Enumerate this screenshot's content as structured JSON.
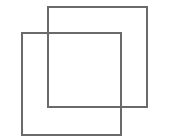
{
  "icon": {
    "name": "copy-icon",
    "shapes": [
      {
        "id": "back-square",
        "color": "#6a6a6a"
      },
      {
        "id": "front-square",
        "color": "#6a6a6a"
      }
    ]
  }
}
